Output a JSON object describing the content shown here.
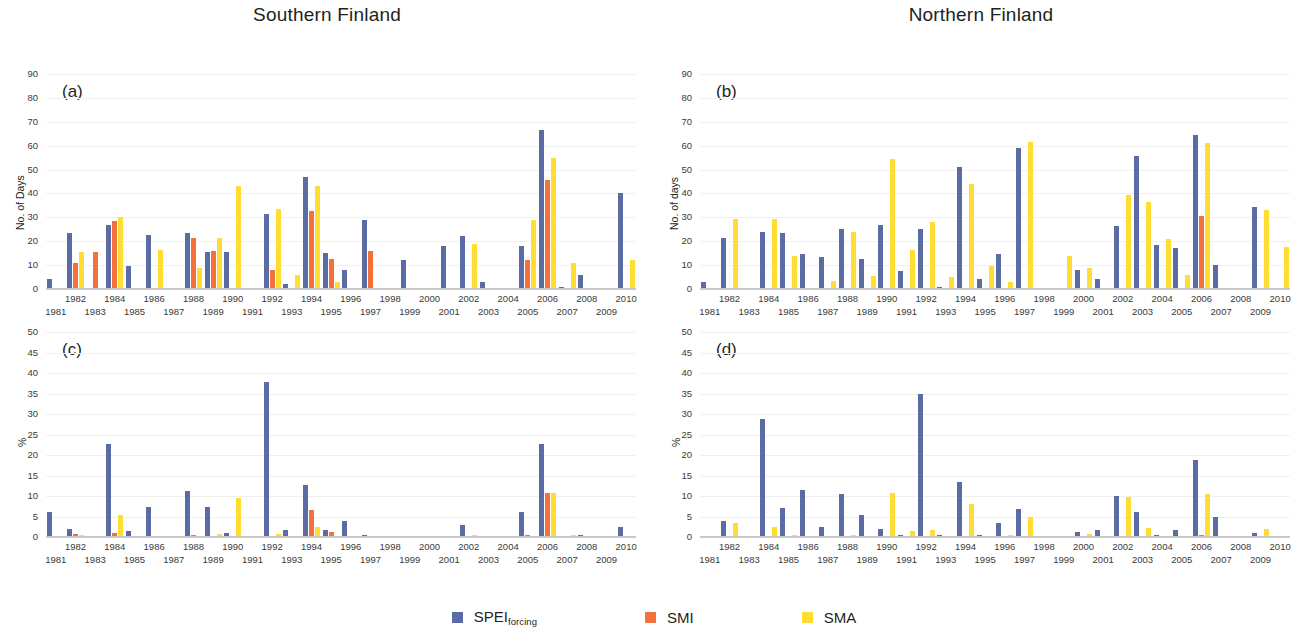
{
  "figure": {
    "legend": [
      {
        "label": "SPEI",
        "sub": "forcing",
        "color": "#5b6ca5",
        "key": "spei"
      },
      {
        "label": "SMI",
        "sub": "",
        "color": "#f4713b",
        "key": "smi"
      },
      {
        "label": "SMA",
        "sub": "",
        "color": "#ffdd33",
        "key": "sma"
      }
    ]
  },
  "titles": {
    "south": "Southern Finland",
    "north": "Northern Finland"
  },
  "letters": {
    "a": "(a)",
    "b": "(b)",
    "c": "(c)",
    "d": "(d)"
  },
  "chart_data": [
    {
      "id": "a",
      "type": "bar",
      "title": "Southern Finland",
      "panel_label": "(a)",
      "xlabel": "",
      "ylabel": "No. of Days",
      "ylim": [
        0,
        90
      ],
      "yticks": [
        0,
        10,
        20,
        30,
        40,
        50,
        60,
        70,
        80,
        90
      ],
      "grid": true,
      "legend_position": "bottom",
      "categories": [
        1981,
        1982,
        1983,
        1984,
        1985,
        1986,
        1987,
        1988,
        1989,
        1990,
        1991,
        1992,
        1993,
        1994,
        1995,
        1996,
        1997,
        1998,
        1999,
        2000,
        2001,
        2002,
        2003,
        2004,
        2005,
        2006,
        2007,
        2008,
        2009,
        2010
      ],
      "series": [
        {
          "name": "SPEI_forcing",
          "color": "#5b6ca5",
          "values": [
            4,
            23.5,
            0,
            27,
            9.5,
            22.5,
            0,
            23.5,
            15.5,
            15.5,
            0,
            31.5,
            2,
            47,
            15,
            8,
            29,
            0,
            12,
            0,
            18,
            22,
            3,
            0,
            18,
            66.5,
            1,
            6,
            0.5,
            40
          ]
        },
        {
          "name": "SMI",
          "color": "#f4713b",
          "values": [
            0,
            11,
            15.5,
            28.5,
            0,
            0,
            0,
            21.5,
            16,
            0,
            0,
            8,
            0,
            32.5,
            12.5,
            0,
            16,
            0,
            0,
            0,
            0,
            0,
            0,
            0,
            12,
            45.5,
            0,
            0,
            0,
            0
          ]
        },
        {
          "name": "SMA",
          "color": "#ffdd33",
          "values": [
            0,
            15.5,
            0,
            30,
            0,
            16.5,
            0,
            9,
            21.5,
            43,
            0,
            33.5,
            6,
            43,
            3,
            0,
            0,
            0,
            0,
            0,
            0,
            19,
            0,
            0,
            29,
            55,
            11,
            0,
            0,
            12
          ]
        }
      ]
    },
    {
      "id": "b",
      "type": "bar",
      "title": "Northern Finland",
      "panel_label": "(b)",
      "xlabel": "",
      "ylabel": "No. of days",
      "ylim": [
        0,
        90
      ],
      "yticks": [
        0,
        10,
        20,
        30,
        40,
        50,
        60,
        70,
        80,
        90
      ],
      "grid": true,
      "legend_position": "bottom",
      "categories": [
        1981,
        1982,
        1983,
        1984,
        1985,
        1986,
        1987,
        1988,
        1989,
        1990,
        1991,
        1992,
        1993,
        1994,
        1995,
        1996,
        1997,
        1998,
        1999,
        2000,
        2001,
        2002,
        2003,
        2004,
        2005,
        2006,
        2007,
        2008,
        2009,
        2010
      ],
      "series": [
        {
          "name": "SPEI_forcing",
          "color": "#5b6ca5",
          "values": [
            3,
            21.5,
            0,
            24,
            23.5,
            14.5,
            13.5,
            25,
            12.5,
            27,
            7.5,
            25,
            1,
            51,
            4,
            14.5,
            59,
            0,
            0,
            8,
            4,
            26.5,
            55.5,
            18.5,
            17,
            64.5,
            10,
            0,
            34.5,
            0
          ]
        },
        {
          "name": "SMI",
          "color": "#f4713b",
          "values": [
            0,
            0,
            0,
            0,
            0,
            0,
            0,
            0,
            0,
            0,
            0,
            0,
            0,
            0,
            0,
            0,
            0,
            0,
            0,
            0,
            0,
            0,
            0,
            0,
            0,
            30.5,
            0,
            0,
            0,
            0
          ]
        },
        {
          "name": "SMA",
          "color": "#ffdd33",
          "values": [
            0,
            29.5,
            0,
            29.5,
            14,
            0,
            3.5,
            24,
            5.5,
            54.5,
            16.5,
            28,
            5,
            44,
            9.5,
            3,
            61.5,
            0,
            14,
            9,
            0,
            39.5,
            36.5,
            21,
            6,
            61,
            0,
            0,
            33,
            17.5
          ]
        }
      ]
    },
    {
      "id": "c",
      "type": "bar",
      "title": "Southern Finland",
      "panel_label": "(c)",
      "xlabel": "",
      "ylabel": "%",
      "ylim": [
        0,
        50
      ],
      "yticks": [
        0,
        5,
        10,
        15,
        20,
        25,
        30,
        35,
        40,
        45,
        50
      ],
      "grid": true,
      "legend_position": "bottom",
      "categories": [
        1981,
        1982,
        1983,
        1984,
        1985,
        1986,
        1987,
        1988,
        1989,
        1990,
        1991,
        1992,
        1993,
        1994,
        1995,
        1996,
        1997,
        1998,
        1999,
        2000,
        2001,
        2002,
        2003,
        2004,
        2005,
        2006,
        2007,
        2008,
        2009,
        2010
      ],
      "series": [
        {
          "name": "SPEI_forcing",
          "color": "#5b6ca5",
          "values": [
            6,
            1.9,
            0,
            22.7,
            1.4,
            7.4,
            0,
            11.2,
            7.2,
            0.9,
            0,
            37.9,
            1.8,
            12.6,
            1.8,
            3.9,
            0.5,
            0,
            0.2,
            0,
            0.3,
            2.9,
            0,
            0,
            6.2,
            22.6,
            0,
            0.4,
            0,
            2.4
          ]
        },
        {
          "name": "SMI",
          "color": "#f4713b",
          "values": [
            0,
            0.7,
            0,
            1,
            0,
            0,
            0,
            0.4,
            0,
            0,
            0,
            0.3,
            0,
            6.7,
            1.3,
            0,
            0,
            0,
            0,
            0,
            0,
            0,
            0,
            0,
            0.4,
            10.8,
            0,
            0,
            0,
            0
          ]
        },
        {
          "name": "SMA",
          "color": "#ffdd33",
          "values": [
            0,
            0.5,
            0.2,
            5.4,
            0,
            0,
            0,
            0.2,
            0.8,
            9.5,
            0,
            0.7,
            0,
            2.4,
            0.2,
            0,
            0.2,
            0,
            0,
            0,
            0,
            0.6,
            0.2,
            0,
            0.3,
            10.7,
            0.4,
            0,
            0.2,
            0
          ]
        }
      ]
    },
    {
      "id": "d",
      "type": "bar",
      "title": "Northern Finland",
      "panel_label": "(d)",
      "xlabel": "",
      "ylabel": "%",
      "ylim": [
        0,
        50
      ],
      "yticks": [
        0,
        5,
        10,
        15,
        20,
        25,
        30,
        35,
        40,
        45,
        50
      ],
      "grid": true,
      "legend_position": "bottom",
      "categories": [
        1981,
        1982,
        1983,
        1984,
        1985,
        1986,
        1987,
        1988,
        1989,
        1990,
        1991,
        1992,
        1993,
        1994,
        1995,
        1996,
        1997,
        1998,
        1999,
        2000,
        2001,
        2002,
        2003,
        2004,
        2005,
        2006,
        2007,
        2008,
        2009,
        2010
      ],
      "series": [
        {
          "name": "SPEI_forcing",
          "color": "#5b6ca5",
          "values": [
            0.3,
            3.9,
            0,
            28.8,
            7.1,
            11.4,
            2.5,
            10.6,
            5.3,
            1.9,
            0.4,
            35,
            0.4,
            13.3,
            0.4,
            3.4,
            6.8,
            0,
            0,
            1.2,
            1.7,
            10.1,
            6.1,
            0.5,
            1.7,
            18.9,
            4.8,
            0,
            1.1,
            0
          ]
        },
        {
          "name": "SMI",
          "color": "#f4713b",
          "values": [
            0,
            0,
            0,
            0,
            0,
            0,
            0,
            0,
            0,
            0,
            0,
            0,
            0,
            0,
            0,
            0,
            0,
            0,
            0,
            0,
            0,
            0,
            0,
            0,
            0,
            0.4,
            0,
            0,
            0,
            0
          ]
        },
        {
          "name": "SMA",
          "color": "#ffdd33",
          "values": [
            0.2,
            3.4,
            0,
            2.4,
            0.6,
            0.3,
            0.1,
            0.5,
            0.2,
            10.8,
            1.4,
            1.6,
            0,
            8.1,
            0.2,
            0.5,
            5,
            0,
            0,
            0.8,
            0,
            9.8,
            2.3,
            0.2,
            0.1,
            10.4,
            0,
            0,
            1.9,
            0.3
          ]
        }
      ]
    }
  ]
}
